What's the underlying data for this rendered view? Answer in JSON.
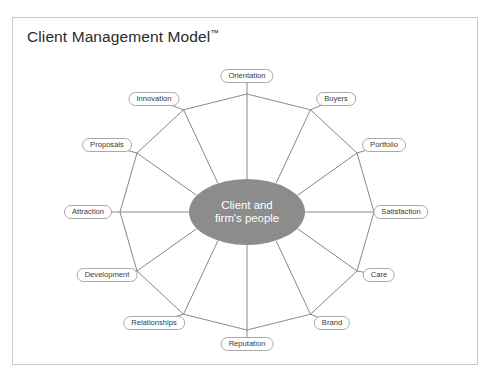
{
  "document": {
    "title": "Client Management Model",
    "trademark": "™",
    "background_color": "#ffffff",
    "border_color": "#c9c9c9"
  },
  "diagram": {
    "type": "radial-wheel",
    "spoke_count": 12,
    "hub": {
      "label_line1": "Client and",
      "label_line2": "firm's people",
      "fill_color": "#8c8c8c",
      "text_color": "#ffffff",
      "center_x": 247,
      "center_y": 212,
      "radius_x": 58,
      "radius_y": 33
    },
    "ring": {
      "stroke_color": "#7a7a7a",
      "radius_x": 127,
      "radius_y": 118,
      "vertex_count": 12
    },
    "nodes": [
      {
        "label": "Orientation",
        "angle_deg": 270,
        "x": 247,
        "y": 76
      },
      {
        "label": "Buyers",
        "angle_deg": 300,
        "x": 336,
        "y": 99
      },
      {
        "label": "Portfolio",
        "angle_deg": 330,
        "x": 384,
        "y": 145
      },
      {
        "label": "Satisfaction",
        "angle_deg": 0,
        "x": 401,
        "y": 212
      },
      {
        "label": "Care",
        "angle_deg": 30,
        "x": 379,
        "y": 275
      },
      {
        "label": "Brand",
        "angle_deg": 60,
        "x": 332,
        "y": 323
      },
      {
        "label": "Reputation",
        "angle_deg": 90,
        "x": 247,
        "y": 344
      },
      {
        "label": "Relationships",
        "angle_deg": 120,
        "x": 154,
        "y": 323
      },
      {
        "label": "Development",
        "angle_deg": 150,
        "x": 107,
        "y": 275
      },
      {
        "label": "Attraction",
        "angle_deg": 180,
        "x": 88,
        "y": 212
      },
      {
        "label": "Proposals",
        "angle_deg": 210,
        "x": 107,
        "y": 145
      },
      {
        "label": "Innovation",
        "angle_deg": 240,
        "x": 154,
        "y": 99
      }
    ]
  }
}
